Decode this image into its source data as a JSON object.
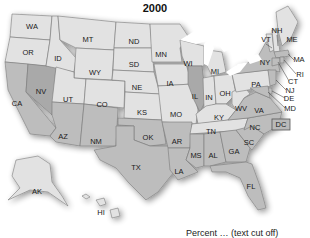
{
  "title": "2000",
  "caption": "Percent … (text cut off)",
  "colors": {
    "light": "#e2e2e2",
    "medium": "#bdbdbd",
    "dark": "#a9a9a9",
    "lake": "#ffffff",
    "border": "#7a7a7a"
  },
  "states": {
    "WA": "WA",
    "OR": "OR",
    "CA": "CA",
    "NV": "NV",
    "ID": "ID",
    "MT": "MT",
    "WY": "WY",
    "UT": "UT",
    "CO": "CO",
    "AZ": "AZ",
    "NM": "NM",
    "ND": "ND",
    "SD": "SD",
    "NE": "NE",
    "KS": "KS",
    "OK": "OK",
    "TX": "TX",
    "MN": "MN",
    "IA": "IA",
    "MO": "MO",
    "AR": "AR",
    "LA": "LA",
    "WI": "WI",
    "IL": "IL",
    "MI": "MI",
    "IN": "IN",
    "OH": "OH",
    "KY": "KY",
    "TN": "TN",
    "MS": "MS",
    "AL": "AL",
    "GA": "GA",
    "FL": "FL",
    "SC": "SC",
    "NC": "NC",
    "VA": "VA",
    "WV": "WV",
    "PA": "PA",
    "NY": "NY",
    "VT": "VT",
    "NH": "NH",
    "ME": "ME",
    "MA": "MA",
    "RI": "RI",
    "CT": "CT",
    "NJ": "NJ",
    "DE": "DE",
    "MD": "MD",
    "DC": "DC",
    "AK": "AK",
    "HI": "HI"
  }
}
